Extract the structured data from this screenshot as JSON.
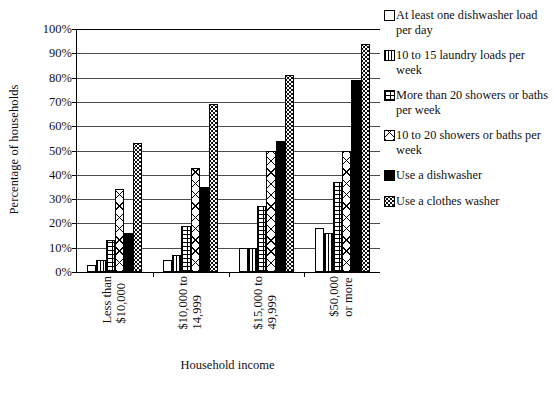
{
  "chart_data": {
    "type": "bar",
    "title": "",
    "xlabel": "Household income",
    "ylabel": "Percentage of households",
    "ylim": [
      0,
      100
    ],
    "yticks": [
      "0%",
      "10%",
      "20%",
      "30%",
      "40%",
      "50%",
      "60%",
      "70%",
      "80%",
      "90%",
      "100%"
    ],
    "ytick_values": [
      0,
      10,
      20,
      30,
      40,
      50,
      60,
      70,
      80,
      90,
      100
    ],
    "grid": true,
    "legend_position": "right",
    "categories": [
      "Less than $10,000",
      "$10,000 to 14,999",
      "$15,000 to 49,999",
      "$50,000 or more"
    ],
    "category_lines": [
      [
        "Less than",
        "$10,000"
      ],
      [
        "$10,000 to",
        "14,999"
      ],
      [
        "$15,000 to",
        "49,999"
      ],
      [
        "$50,000",
        "or more"
      ]
    ],
    "series": [
      {
        "name": "At least one dishwasher load per day",
        "name_lines": [
          "At least one dishwasher",
          "load per day"
        ],
        "pattern": "plain",
        "values": [
          3,
          5,
          10,
          18
        ]
      },
      {
        "name": "10 to 15 laundry loads per week",
        "name_lines": [
          "10 to 15 laundry loads",
          "per week"
        ],
        "pattern": "vert",
        "values": [
          5,
          7,
          10,
          16
        ]
      },
      {
        "name": "More than 20 showers or baths per week",
        "name_lines": [
          "More than 20 showers",
          "or baths per week"
        ],
        "pattern": "brick",
        "values": [
          13,
          19,
          27,
          37
        ]
      },
      {
        "name": "10 to 20 showers or baths per week",
        "name_lines": [
          "10 to 20 showers or",
          "baths per week"
        ],
        "pattern": "cross",
        "values": [
          34,
          43,
          50,
          50
        ]
      },
      {
        "name": "Use a dishwasher",
        "name_lines": [
          "Use a dishwasher"
        ],
        "pattern": "solid",
        "values": [
          16,
          35,
          54,
          79
        ]
      },
      {
        "name": "Use a clothes washer",
        "name_lines": [
          "Use a clothes washer"
        ],
        "pattern": "dots",
        "values": [
          53,
          69,
          81,
          94
        ]
      }
    ]
  }
}
